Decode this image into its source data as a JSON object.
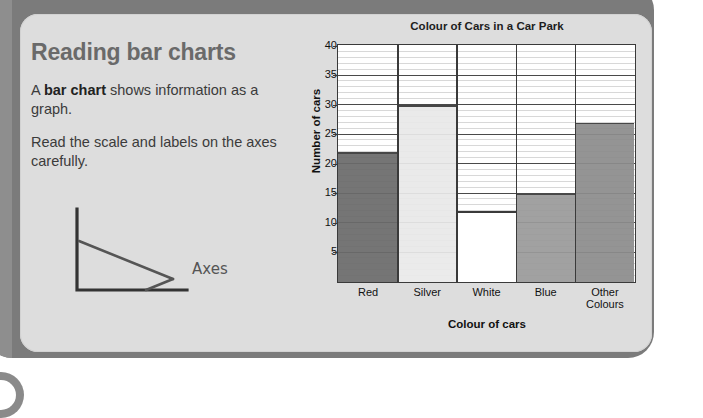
{
  "page": {
    "lesson_title": "Reading bar charts",
    "paragraphs": [
      {
        "lead": "A ",
        "bold": "bar chart",
        "rest": " shows information as a graph."
      },
      {
        "lead": "Read the scale and labels on the axes carefully.",
        "bold": "",
        "rest": ""
      }
    ],
    "para1_lead": "A ",
    "para1_bold": "bar chart",
    "para1_rest": " shows information as a graph.",
    "para2": "Read the scale and labels on the axes carefully.",
    "axes_sketch_label": "Axes"
  },
  "colors": {
    "card_border": "#7b7b7b",
    "card_fill": "#dddddd",
    "title_gray": "#6a6a6a",
    "axis_black": "#3a3a3a",
    "bar_red": "#6b6b6b",
    "bar_silver": "#e9e9e9",
    "bar_white": "#ffffff",
    "bar_blue": "#9a9a9a",
    "bar_other": "#8c8c8c"
  },
  "chart_data": {
    "type": "bar",
    "title": "Colour of Cars in a Car Park",
    "xlabel": "Colour of cars",
    "ylabel": "Number of cars",
    "categories": [
      "Red",
      "Silver",
      "White",
      "Blue",
      "Other Colours"
    ],
    "category_lines": [
      [
        "Red"
      ],
      [
        "Silver"
      ],
      [
        "White"
      ],
      [
        "Blue"
      ],
      [
        "Other",
        "Colours"
      ]
    ],
    "values": [
      22,
      30,
      12,
      15,
      27
    ],
    "bar_fills": [
      "#6b6b6b",
      "#e9e9e9",
      "#ffffff",
      "#9a9a9a",
      "#8c8c8c"
    ],
    "ylim": [
      0,
      40
    ],
    "ytick_step": 5,
    "yticks": [
      40,
      35,
      30,
      25,
      20,
      15,
      10,
      5
    ],
    "grid": true,
    "grid_minor_step": 1,
    "legend": null
  }
}
